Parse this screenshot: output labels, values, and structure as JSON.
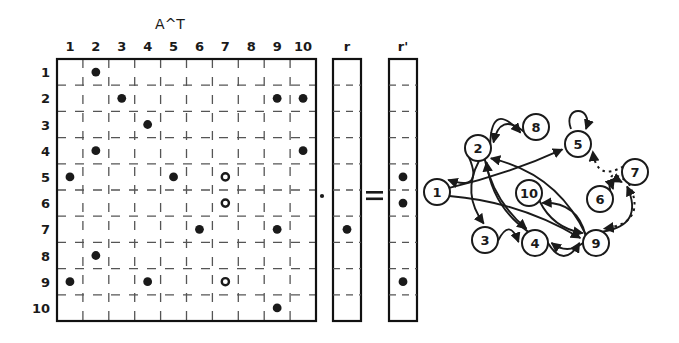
{
  "figure": {
    "matrix_title": "A^T",
    "vector_r_label": "r",
    "vector_r2_label": "r'",
    "operator_dot": "·",
    "operator_equals": "=",
    "colors": {
      "ink": "#1a1a1a",
      "background": "#ffffff",
      "grid_dash": "#555555",
      "border": "#111111"
    }
  },
  "matrix": {
    "name": "A^T",
    "rows": 10,
    "cols": 10,
    "col_headers": [
      "1",
      "2",
      "3",
      "4",
      "5",
      "6",
      "7",
      "8",
      "9",
      "10"
    ],
    "row_headers": [
      "1",
      "2",
      "3",
      "4",
      "5",
      "6",
      "7",
      "8",
      "9",
      "10"
    ],
    "filled_cells": [
      {
        "row": 1,
        "col": 2
      },
      {
        "row": 2,
        "col": 3
      },
      {
        "row": 2,
        "col": 9
      },
      {
        "row": 2,
        "col": 10
      },
      {
        "row": 3,
        "col": 4
      },
      {
        "row": 4,
        "col": 2
      },
      {
        "row": 4,
        "col": 10
      },
      {
        "row": 5,
        "col": 1
      },
      {
        "row": 5,
        "col": 5
      },
      {
        "row": 7,
        "col": 6
      },
      {
        "row": 7,
        "col": 9
      },
      {
        "row": 8,
        "col": 2
      },
      {
        "row": 9,
        "col": 1
      },
      {
        "row": 9,
        "col": 4
      },
      {
        "row": 10,
        "col": 9
      }
    ],
    "hollow_cells": [
      {
        "row": 5,
        "col": 7
      },
      {
        "row": 6,
        "col": 7
      },
      {
        "row": 9,
        "col": 7
      }
    ]
  },
  "vector_r": {
    "label": "r",
    "rows": 10,
    "filled_rows": [
      7
    ]
  },
  "vector_r_prime": {
    "label": "r'",
    "rows": 10,
    "filled_rows": [
      5,
      6,
      9
    ]
  },
  "graph": {
    "nodes": [
      {
        "id": "1",
        "label": "1",
        "x": 437,
        "y": 192
      },
      {
        "id": "2",
        "label": "2",
        "x": 478,
        "y": 148
      },
      {
        "id": "3",
        "label": "3",
        "x": 485,
        "y": 240
      },
      {
        "id": "4",
        "label": "4",
        "x": 535,
        "y": 243
      },
      {
        "id": "5",
        "label": "5",
        "x": 578,
        "y": 144
      },
      {
        "id": "6",
        "label": "6",
        "x": 600,
        "y": 199
      },
      {
        "id": "7",
        "label": "7",
        "x": 635,
        "y": 172
      },
      {
        "id": "8",
        "label": "8",
        "x": 536,
        "y": 127
      },
      {
        "id": "9",
        "label": "9",
        "x": 596,
        "y": 243
      },
      {
        "id": "10",
        "label": "10",
        "x": 529,
        "y": 193
      }
    ],
    "node_radius": 13,
    "edges": [
      {
        "from": "2",
        "to": "1",
        "style": "solid"
      },
      {
        "from": "2",
        "to": "8",
        "style": "solid"
      },
      {
        "from": "1",
        "to": "5",
        "style": "solid"
      },
      {
        "from": "9",
        "to": "2",
        "style": "solid"
      },
      {
        "from": "8",
        "to": "2",
        "style": "solid"
      },
      {
        "from": "2",
        "to": "3",
        "style": "solid"
      },
      {
        "from": "2",
        "to": "4",
        "style": "solid"
      },
      {
        "from": "1",
        "to": "9",
        "style": "solid"
      },
      {
        "from": "3",
        "to": "4",
        "style": "solid"
      },
      {
        "from": "4",
        "to": "9",
        "style": "solid"
      },
      {
        "from": "9",
        "to": "4",
        "style": "solid"
      },
      {
        "from": "10",
        "to": "9",
        "style": "solid"
      },
      {
        "from": "9",
        "to": "10",
        "style": "solid"
      },
      {
        "from": "4",
        "to": "2",
        "style": "solid"
      },
      {
        "from": "5",
        "to": "5",
        "style": "solid"
      },
      {
        "from": "6",
        "to": "7",
        "style": "solid"
      },
      {
        "from": "9",
        "to": "7",
        "style": "solid"
      },
      {
        "from": "7",
        "to": "5",
        "style": "dotted"
      },
      {
        "from": "7",
        "to": "6",
        "style": "dotted"
      },
      {
        "from": "7",
        "to": "9",
        "style": "dotted"
      }
    ]
  }
}
